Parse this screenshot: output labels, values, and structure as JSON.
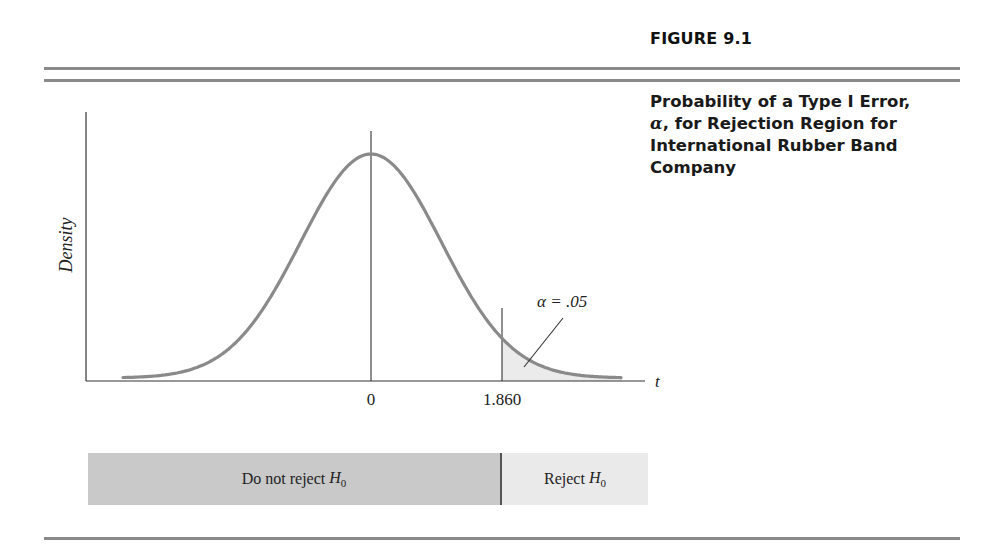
{
  "figure": {
    "label": "FIGURE 9.1",
    "caption": {
      "line1": "Probability of a Type I Error,",
      "alpha_symbol": "α",
      "line2_rest": ", for Rejection Region for",
      "line3": "International Rubber Band",
      "line4": "Company"
    }
  },
  "chart_data": {
    "type": "area",
    "title": "Probability of a Type I Error, α, for Rejection Region for International Rubber Band Company",
    "xlabel": "t",
    "ylabel": "Density",
    "distribution": "t (one-tailed, upper)",
    "x_ticks": [
      "0",
      "1.860"
    ],
    "critical_value": 1.86,
    "shaded_region": {
      "from": 1.86,
      "to": "inf",
      "label": "α = .05",
      "area": 0.05
    },
    "annotation": "α = .05",
    "grid": false,
    "legend": null,
    "regions": [
      {
        "label": "Do not reject",
        "symbol": "H",
        "subscript": "0",
        "range": "t < 1.860"
      },
      {
        "label": "Reject",
        "symbol": "H",
        "subscript": "0",
        "range": "t ≥ 1.860"
      }
    ]
  },
  "colors": {
    "curve": "#8a8a8a",
    "shade": "#ebebeb",
    "axis": "#333333",
    "rule": "#8a8a8a",
    "accept_bar": "#c9c9c9",
    "reject_bar": "#eaeaea"
  }
}
